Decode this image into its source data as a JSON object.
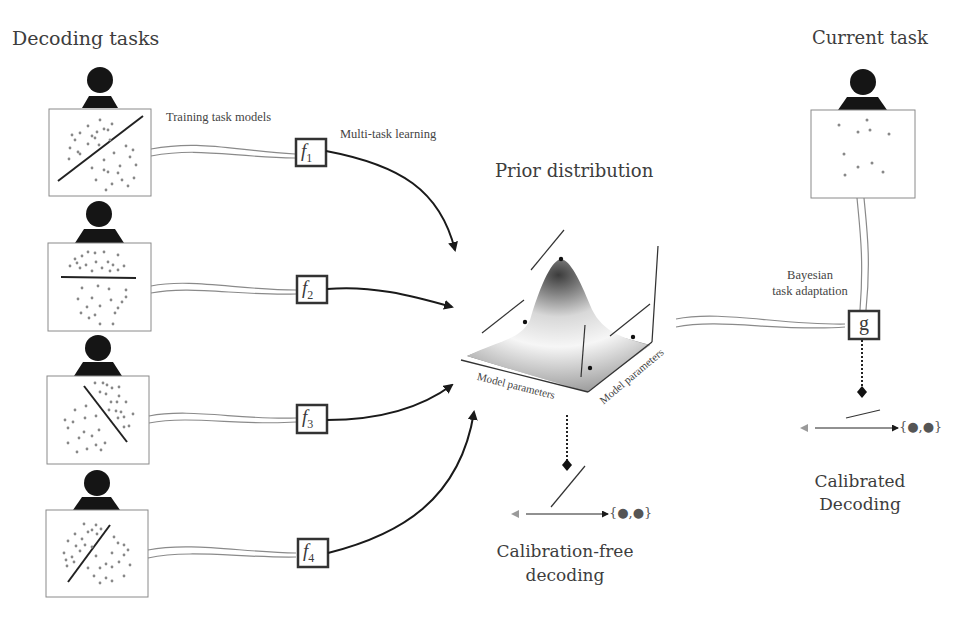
{
  "titles": {
    "decoding_tasks": "Decoding tasks",
    "current_task": "Current task",
    "prior_distribution": "Prior distribution",
    "calibration_free_line1": "Calibration-free",
    "calibration_free_line2": "decoding",
    "calibrated_line1": "Calibrated",
    "calibrated_line2": "Decoding"
  },
  "labels": {
    "training_task_models": "Training task models",
    "multi_task_learning": "Multi-task learning",
    "bayesian_line1": "Bayesian",
    "bayesian_line2": "task adaptation",
    "model_parameters_x": "Model parameters",
    "model_parameters_y": "Model parameters"
  },
  "tasks": [
    {
      "id": "task-1",
      "model": "f",
      "subscript": "1",
      "boundary": "diagonal-up"
    },
    {
      "id": "task-2",
      "model": "f",
      "subscript": "2",
      "boundary": "horizontal"
    },
    {
      "id": "task-3",
      "model": "f",
      "subscript": "3",
      "boundary": "diagonal-down"
    },
    {
      "id": "task-4",
      "model": "f",
      "subscript": "4",
      "boundary": "diagonal-up-steep"
    }
  ],
  "current_task": {
    "model": "g"
  },
  "output_set": "{●,●}",
  "colors": {
    "ink": "#1a1a1a",
    "dots": "#888888",
    "double_line": "#8a8a8a",
    "surface_dark": "#5a5a5a",
    "surface_light": "#f2f2f2"
  }
}
